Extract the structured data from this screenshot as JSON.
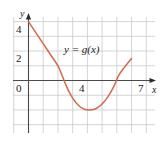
{
  "chart_data": {
    "type": "line",
    "title": "",
    "xlabel": "x",
    "ylabel": "y",
    "annotation": "y = g(x)",
    "grid": true,
    "legend_position": "none",
    "xlim": [
      -1,
      8.7
    ],
    "ylim": [
      -3.3,
      5.2
    ],
    "x_ticks": [
      4,
      7
    ],
    "x_tick_labels": [
      "4",
      "7"
    ],
    "y_ticks": [
      0,
      2,
      4
    ],
    "y_tick_labels": [
      "0",
      "2",
      "4"
    ],
    "series": [
      {
        "name": "g(x)",
        "color": "#d4694c",
        "points": [
          [
            0.0,
            4.0
          ],
          [
            0.5,
            3.25
          ],
          [
            1.0,
            2.5
          ],
          [
            1.5,
            1.75
          ],
          [
            2.0,
            1.0
          ],
          [
            2.3,
            0.3
          ],
          [
            2.6,
            -0.45
          ],
          [
            3.0,
            -1.2
          ],
          [
            3.4,
            -1.7
          ],
          [
            3.8,
            -1.95
          ],
          [
            4.2,
            -2.0
          ],
          [
            4.6,
            -1.9
          ],
          [
            5.0,
            -1.6
          ],
          [
            5.4,
            -1.1
          ],
          [
            5.8,
            -0.4
          ],
          [
            6.1,
            0.3
          ],
          [
            6.4,
            0.75
          ],
          [
            7.0,
            1.5
          ]
        ]
      }
    ]
  },
  "axes": {
    "y_name": "y",
    "x_name": "x"
  },
  "ticks": {
    "y4": "4",
    "y2": "2",
    "y0": "0",
    "x4": "4",
    "x7": "7"
  },
  "annotation": {
    "text": "y = g(x)"
  },
  "colors": {
    "curve": "#d4694c",
    "grid": "#c9c9c9",
    "axis": "#4a4a4a",
    "background": "#ffffff",
    "text": "#1a1a1a"
  }
}
